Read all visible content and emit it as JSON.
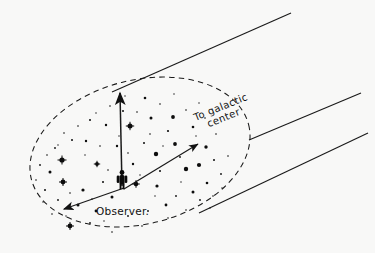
{
  "figure": {
    "type": "astronomy-schematic",
    "background_color": "#f8f8f7",
    "ink_color": "#1a1a1a",
    "labels": {
      "observer": "Observer.",
      "galactic_center_line1": "To galactic",
      "galactic_center_line2": "center"
    },
    "elements": [
      {
        "name": "halo-boundary",
        "kind": "dashed-ellipse",
        "description": "Dashed oval outlining the local stellar neighborhood"
      },
      {
        "name": "observer-figure",
        "kind": "human-silhouette",
        "description": "Small standing human figure marking the observer"
      },
      {
        "name": "vertical-arrow",
        "kind": "arrow",
        "description": "Arrow from observer pointing straight up out of the galactic plane"
      },
      {
        "name": "galactic-center-arrow",
        "kind": "arrow",
        "description": "Arrow from observer pointing up-right toward the galactic center"
      },
      {
        "name": "anti-center-arrow",
        "kind": "arrow",
        "description": "Arrow from observer pointing down-left away from the galactic center"
      },
      {
        "name": "cone-line-upper",
        "kind": "line",
        "description": "Upper straight line running to the upper right"
      },
      {
        "name": "cone-line-middle",
        "kind": "line",
        "description": "Middle straight line running to the upper right"
      },
      {
        "name": "cone-line-lower",
        "kind": "line",
        "description": "Lower straight line running to the upper right"
      },
      {
        "name": "star-field",
        "kind": "scatter-of-dots",
        "description": "Field of stars of varying brightness filling the oval"
      }
    ],
    "geometry": {
      "ellipse": {
        "cx": 140,
        "cy": 152,
        "rx": 112,
        "ry": 72,
        "rotation": -14
      },
      "observer": {
        "x": 122,
        "y": 189
      },
      "vertical_arrow": {
        "x1": 122,
        "y1": 186,
        "x2": 120,
        "y2": 92
      },
      "center_arrow": {
        "x1": 122,
        "y1": 188,
        "x2": 199,
        "y2": 143
      },
      "anticenter_arrow": {
        "x1": 122,
        "y1": 188,
        "x2": 63,
        "y2": 210
      },
      "line_upper": {
        "x1": 112,
        "y1": 92,
        "x2": 290,
        "y2": 14
      },
      "line_middle": {
        "x1": 250,
        "y1": 139,
        "x2": 360,
        "y2": 94
      },
      "line_lower": {
        "x1": 200,
        "y1": 212,
        "x2": 367,
        "y2": 134
      },
      "label_observer": {
        "x": 96,
        "y": 214
      },
      "label_galactic": {
        "x": 196,
        "y": 120,
        "rotation": -22
      }
    },
    "stars": [
      {
        "x": 62,
        "y": 160,
        "r": 2.6,
        "kind": "bright"
      },
      {
        "x": 130,
        "y": 126,
        "r": 2.5,
        "kind": "bright"
      },
      {
        "x": 63,
        "y": 182,
        "r": 2.4,
        "kind": "bright"
      },
      {
        "x": 136,
        "y": 184,
        "r": 2.3,
        "kind": "bright"
      },
      {
        "x": 70,
        "y": 226,
        "r": 2.4,
        "kind": "bright"
      },
      {
        "x": 156,
        "y": 154,
        "r": 2.2,
        "kind": "bright"
      },
      {
        "x": 186,
        "y": 169,
        "r": 2.2,
        "kind": "bright"
      },
      {
        "x": 199,
        "y": 165,
        "r": 2.1,
        "kind": "bright"
      },
      {
        "x": 97,
        "y": 164,
        "r": 1.9,
        "kind": "medium"
      },
      {
        "x": 173,
        "y": 117,
        "r": 1.9,
        "kind": "medium"
      },
      {
        "x": 175,
        "y": 144,
        "r": 1.9,
        "kind": "medium"
      },
      {
        "x": 151,
        "y": 118,
        "r": 1.5,
        "kind": "medium"
      },
      {
        "x": 206,
        "y": 147,
        "r": 1.7,
        "kind": "medium"
      },
      {
        "x": 157,
        "y": 186,
        "r": 1.6,
        "kind": "medium"
      },
      {
        "x": 112,
        "y": 197,
        "r": 1.5,
        "kind": "medium"
      },
      {
        "x": 83,
        "y": 190,
        "r": 1.6,
        "kind": "medium"
      },
      {
        "x": 50,
        "y": 172,
        "r": 1.5,
        "kind": "medium"
      },
      {
        "x": 78,
        "y": 205,
        "r": 1.5,
        "kind": "medium"
      },
      {
        "x": 96,
        "y": 211,
        "r": 1.4,
        "kind": "medium"
      },
      {
        "x": 193,
        "y": 192,
        "r": 1.5,
        "kind": "medium"
      },
      {
        "x": 166,
        "y": 205,
        "r": 1.4,
        "kind": "medium"
      },
      {
        "x": 207,
        "y": 183,
        "r": 1.3,
        "kind": "medium"
      },
      {
        "x": 145,
        "y": 98,
        "r": 1.3,
        "kind": "medium"
      },
      {
        "x": 193,
        "y": 127,
        "r": 1.3,
        "kind": "medium"
      },
      {
        "x": 117,
        "y": 146,
        "r": 1.2,
        "kind": "medium"
      },
      {
        "x": 106,
        "y": 125,
        "r": 1.2,
        "kind": "medium"
      },
      {
        "x": 86,
        "y": 141,
        "r": 1.2,
        "kind": "medium"
      },
      {
        "x": 133,
        "y": 164,
        "r": 1.2,
        "kind": "medium"
      },
      {
        "x": 168,
        "y": 131,
        "r": 1.1,
        "kind": "faint"
      },
      {
        "x": 123,
        "y": 111,
        "r": 1.0,
        "kind": "faint"
      },
      {
        "x": 90,
        "y": 120,
        "r": 1.0,
        "kind": "faint"
      },
      {
        "x": 72,
        "y": 140,
        "r": 1.0,
        "kind": "faint"
      },
      {
        "x": 55,
        "y": 148,
        "r": 0.9,
        "kind": "faint"
      },
      {
        "x": 45,
        "y": 190,
        "r": 1.0,
        "kind": "faint"
      },
      {
        "x": 58,
        "y": 200,
        "r": 0.9,
        "kind": "faint"
      },
      {
        "x": 40,
        "y": 165,
        "r": 0.9,
        "kind": "faint"
      },
      {
        "x": 103,
        "y": 182,
        "r": 1.0,
        "kind": "faint"
      },
      {
        "x": 144,
        "y": 143,
        "r": 1.0,
        "kind": "faint"
      },
      {
        "x": 160,
        "y": 171,
        "r": 1.0,
        "kind": "faint"
      },
      {
        "x": 180,
        "y": 157,
        "r": 0.9,
        "kind": "faint"
      },
      {
        "x": 214,
        "y": 160,
        "r": 1.0,
        "kind": "faint"
      },
      {
        "x": 221,
        "y": 174,
        "r": 0.9,
        "kind": "faint"
      },
      {
        "x": 200,
        "y": 200,
        "r": 0.9,
        "kind": "faint"
      },
      {
        "x": 176,
        "y": 196,
        "r": 0.9,
        "kind": "faint"
      },
      {
        "x": 148,
        "y": 211,
        "r": 0.9,
        "kind": "faint"
      },
      {
        "x": 128,
        "y": 216,
        "r": 0.9,
        "kind": "faint"
      },
      {
        "x": 90,
        "y": 223,
        "r": 0.9,
        "kind": "faint"
      },
      {
        "x": 110,
        "y": 106,
        "r": 0.8,
        "kind": "faint"
      },
      {
        "x": 160,
        "y": 104,
        "r": 0.8,
        "kind": "faint"
      },
      {
        "x": 186,
        "y": 110,
        "r": 0.8,
        "kind": "faint"
      },
      {
        "x": 205,
        "y": 118,
        "r": 0.8,
        "kind": "faint"
      },
      {
        "x": 216,
        "y": 134,
        "r": 0.8,
        "kind": "faint"
      },
      {
        "x": 137,
        "y": 112,
        "r": 0.8,
        "kind": "faint"
      },
      {
        "x": 100,
        "y": 146,
        "r": 0.8,
        "kind": "faint"
      },
      {
        "x": 78,
        "y": 126,
        "r": 0.8,
        "kind": "faint"
      },
      {
        "x": 64,
        "y": 133,
        "r": 0.8,
        "kind": "faint"
      },
      {
        "x": 47,
        "y": 155,
        "r": 0.8,
        "kind": "faint"
      },
      {
        "x": 36,
        "y": 180,
        "r": 0.8,
        "kind": "faint"
      },
      {
        "x": 52,
        "y": 214,
        "r": 0.8,
        "kind": "faint"
      },
      {
        "x": 112,
        "y": 232,
        "r": 0.8,
        "kind": "faint"
      },
      {
        "x": 142,
        "y": 226,
        "r": 0.8,
        "kind": "faint"
      },
      {
        "x": 186,
        "y": 210,
        "r": 0.8,
        "kind": "faint"
      },
      {
        "x": 213,
        "y": 196,
        "r": 0.8,
        "kind": "faint"
      },
      {
        "x": 228,
        "y": 156,
        "r": 0.8,
        "kind": "faint"
      },
      {
        "x": 150,
        "y": 134,
        "r": 0.8,
        "kind": "faint"
      },
      {
        "x": 128,
        "y": 153,
        "r": 0.8,
        "kind": "faint"
      },
      {
        "x": 108,
        "y": 170,
        "r": 0.8,
        "kind": "faint"
      },
      {
        "x": 92,
        "y": 199,
        "r": 0.8,
        "kind": "faint"
      },
      {
        "x": 70,
        "y": 193,
        "r": 0.8,
        "kind": "faint"
      },
      {
        "x": 168,
        "y": 218,
        "r": 0.8,
        "kind": "faint"
      },
      {
        "x": 196,
        "y": 136,
        "r": 0.7,
        "kind": "faint"
      },
      {
        "x": 163,
        "y": 146,
        "r": 0.7,
        "kind": "faint"
      },
      {
        "x": 140,
        "y": 175,
        "r": 0.7,
        "kind": "faint"
      },
      {
        "x": 119,
        "y": 136,
        "r": 0.7,
        "kind": "faint"
      },
      {
        "x": 85,
        "y": 155,
        "r": 0.7,
        "kind": "faint"
      },
      {
        "x": 58,
        "y": 145,
        "r": 0.7,
        "kind": "faint"
      },
      {
        "x": 43,
        "y": 202,
        "r": 0.7,
        "kind": "faint"
      },
      {
        "x": 66,
        "y": 216,
        "r": 0.7,
        "kind": "faint"
      },
      {
        "x": 104,
        "y": 221,
        "r": 0.7,
        "kind": "faint"
      },
      {
        "x": 155,
        "y": 196,
        "r": 0.7,
        "kind": "faint"
      },
      {
        "x": 181,
        "y": 182,
        "r": 0.7,
        "kind": "faint"
      },
      {
        "x": 222,
        "y": 188,
        "r": 0.7,
        "kind": "faint"
      },
      {
        "x": 210,
        "y": 208,
        "r": 0.7,
        "kind": "faint"
      },
      {
        "x": 174,
        "y": 94,
        "r": 0.7,
        "kind": "faint"
      },
      {
        "x": 199,
        "y": 103,
        "r": 0.7,
        "kind": "faint"
      },
      {
        "x": 125,
        "y": 96,
        "r": 0.7,
        "kind": "faint"
      },
      {
        "x": 96,
        "y": 113,
        "r": 0.7,
        "kind": "faint"
      }
    ],
    "cross_stars": [
      {
        "x": 62,
        "y": 160,
        "len": 4.5
      },
      {
        "x": 130,
        "y": 126,
        "len": 4.2
      },
      {
        "x": 63,
        "y": 182,
        "len": 4.0
      },
      {
        "x": 70,
        "y": 226,
        "len": 4.0
      },
      {
        "x": 136,
        "y": 184,
        "len": 3.8
      },
      {
        "x": 97,
        "y": 164,
        "len": 3.2
      }
    ]
  }
}
